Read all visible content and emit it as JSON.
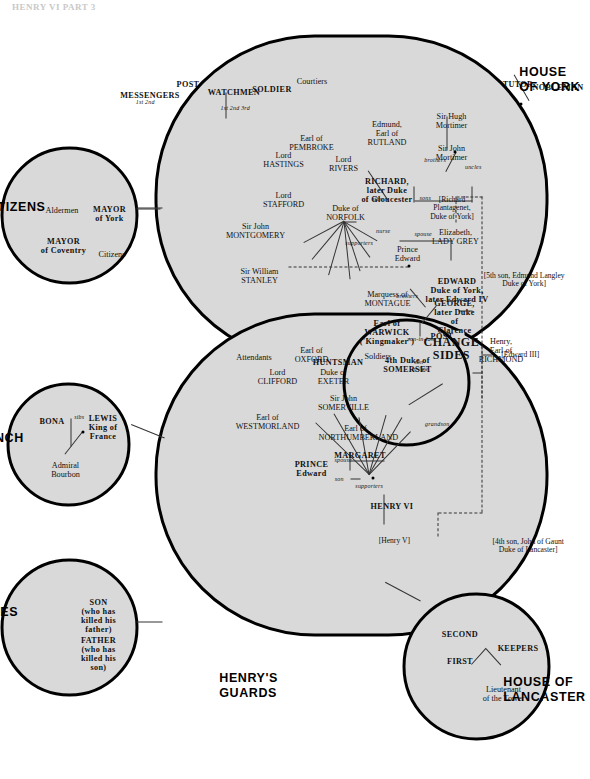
{
  "header": {
    "title": "HENRY VI PART 3"
  },
  "sections": {
    "york": {
      "caption": "HOUSE\nOF YORK"
    },
    "lancaster": {
      "caption": "HOUSE OF\nLANCASTER"
    },
    "guards": {
      "caption": "HENRY'S\nGUARDS"
    },
    "citizens": {
      "caption": "ENGLISH CITIZENS"
    },
    "french": {
      "caption": "THE FRENCH\nCOURT"
    },
    "casualties": {
      "caption": "CASUALTIES\nOF WAR"
    },
    "change": {
      "caption": "CHANGE\nSIDES"
    }
  },
  "ancestry": {
    "edward_iii": "[Edward III]",
    "lancaster_line": "[4th son, John of Gaunt\nDuke of Lancaster]",
    "york_line": "[5th son, Edmund Langley\nDuke of York]"
  },
  "york": {
    "members": [
      {
        "id": "richard-plantagenet",
        "name": "[Richard\nPlantagenet,\nDuke of York]"
      },
      {
        "id": "sir-john-mortimer",
        "name": "Sir John\nMortimer"
      },
      {
        "id": "sir-hugh-mortimer",
        "name": "Sir Hugh\nMortimer"
      },
      {
        "id": "edward-iv",
        "name": "EDWARD\nDuke of York,\nlater Edward IV"
      },
      {
        "id": "elizabeth-lady-grey",
        "name": "Elizabeth,\nLADY GREY"
      },
      {
        "id": "prince-edward",
        "name": "Prince\nEdward"
      },
      {
        "id": "richard-gloucester",
        "name": "RICHARD,\nlater Duke\nof Gloucester"
      },
      {
        "id": "edmund-rutland",
        "name": "Edmund,\nEarl of\nRUTLAND"
      },
      {
        "id": "lord-rivers",
        "name": "Lord\nRIVERS"
      },
      {
        "id": "duke-of-norfolk",
        "name": "Duke of\nNORFOLK"
      },
      {
        "id": "earl-of-pembroke",
        "name": "Earl of\nPEMBROKE"
      },
      {
        "id": "lord-hastings",
        "name": "Lord\nHASTINGS"
      },
      {
        "id": "lord-stafford",
        "name": "Lord\nSTAFFORD"
      },
      {
        "id": "sir-john-montgomery",
        "name": "Sir John\nMONTGOMERY"
      },
      {
        "id": "sir-william-stanley",
        "name": "Sir William\nSTANLEY"
      },
      {
        "id": "tutor",
        "name": "TUTOR"
      },
      {
        "id": "nobleman",
        "name": "NOBLEMAN"
      },
      {
        "id": "courtiers",
        "name": "Courtiers"
      },
      {
        "id": "soldier",
        "name": "SOLDIER"
      },
      {
        "id": "watchmen",
        "name": "WATCHMEN"
      },
      {
        "id": "watchmen-count",
        "name": "1st 2nd 3rd"
      },
      {
        "id": "post",
        "name": "POST"
      },
      {
        "id": "messengers",
        "name": "MESSENGERS"
      },
      {
        "id": "messengers-count",
        "name": "1st 2nd"
      }
    ],
    "relations": [
      {
        "id": "uncles",
        "label": "uncles"
      },
      {
        "id": "sons",
        "label": "sons"
      },
      {
        "id": "spouse",
        "label": "spouse"
      },
      {
        "id": "brothers",
        "label": "brothers"
      },
      {
        "id": "nurse",
        "label": "nurse"
      },
      {
        "id": "sibs",
        "label": "sibs"
      },
      {
        "id": "supporters",
        "label": "supporters"
      }
    ]
  },
  "change_sides": {
    "members": [
      {
        "id": "george-clarence",
        "name": "GEORGE,\nlater Duke\nof\nClarence"
      },
      {
        "id": "duke-of-somerset",
        "name": "4th Duke of\nSOMERSET"
      },
      {
        "id": "earl-of-warwick",
        "name": "Earl of\nWARWICK\n('Kingmaker')"
      },
      {
        "id": "marquess-montague",
        "name": "Marquess of\nMONTAGUE"
      },
      {
        "id": "huntsman",
        "name": "HUNTSMAN"
      }
    ],
    "relations": [
      {
        "id": "son-in-law",
        "label": "son-in-law"
      },
      {
        "id": "brothers2",
        "label": "brothers"
      }
    ]
  },
  "lancaster": {
    "members": [
      {
        "id": "henry-v",
        "name": "[Henry V]"
      },
      {
        "id": "henry-vi",
        "name": "HENRY VI"
      },
      {
        "id": "margaret",
        "name": "MARGARET"
      },
      {
        "id": "prince-edward-l",
        "name": "PRINCE\nEdward"
      },
      {
        "id": "earl-westmorland",
        "name": "Earl of\nWESTMORLAND"
      },
      {
        "id": "lord-clifford",
        "name": "Lord\nCLIFFORD"
      },
      {
        "id": "earl-of-oxford",
        "name": "Earl of\nOXFORD"
      },
      {
        "id": "duke-of-exeter",
        "name": "Duke of\nEXETER"
      },
      {
        "id": "sir-john-somerville",
        "name": "Sir John\nSOMERVILLE"
      },
      {
        "id": "earl-northumberland",
        "name": "Earl of\nNORTHUMBERLAND"
      },
      {
        "id": "henry-richmond",
        "name": "Henry,\nEarl of\nRICHMOND"
      },
      {
        "id": "attendants",
        "name": "Attendants"
      },
      {
        "id": "soldiers",
        "name": "Soldiers"
      },
      {
        "id": "post-l",
        "name": "POST"
      }
    ],
    "relations": [
      {
        "id": "spouse-l",
        "label": "spouse"
      },
      {
        "id": "son-l",
        "label": "son"
      },
      {
        "id": "supporters-l",
        "label": "supporters"
      },
      {
        "id": "grandson",
        "label": "grandson"
      },
      {
        "id": "son-in-law-l",
        "label": "son-\nin-law"
      }
    ]
  },
  "guards": {
    "members": [
      {
        "id": "lieutenant-tower",
        "name": "Lieutenant\nof the Tower"
      },
      {
        "id": "keepers",
        "name": "KEEPERS"
      },
      {
        "id": "first-keeper",
        "name": "FIRST"
      },
      {
        "id": "second-keeper",
        "name": "SECOND"
      }
    ]
  },
  "citizens": {
    "members": [
      {
        "id": "mayor-of-york",
        "name": "MAYOR\nof York"
      },
      {
        "id": "aldermen",
        "name": "Aldermen"
      },
      {
        "id": "citizens",
        "name": "Citizens"
      },
      {
        "id": "mayor-of-coventry",
        "name": "MAYOR\nof Coventry"
      }
    ]
  },
  "french": {
    "members": [
      {
        "id": "lewis-king-france",
        "name": "LEWIS\nKing of\nFrance"
      },
      {
        "id": "bona",
        "name": "BONA"
      },
      {
        "id": "admiral-bourbon",
        "name": "Admiral\nBourbon"
      }
    ],
    "relations": [
      {
        "id": "sibs-fr",
        "label": "sibs"
      }
    ]
  },
  "casualties": {
    "members": [
      {
        "id": "son-killed-father",
        "name": "SON\n(who has\nkilled his\nfather)"
      },
      {
        "id": "father-killed-son",
        "name": "FATHER\n(who has\nkilled his\nson)"
      }
    ]
  },
  "colors": {
    "blob_fill": "#d9d9d9",
    "outline": "#000000",
    "connector": "#333333",
    "page": "#ffffff"
  }
}
